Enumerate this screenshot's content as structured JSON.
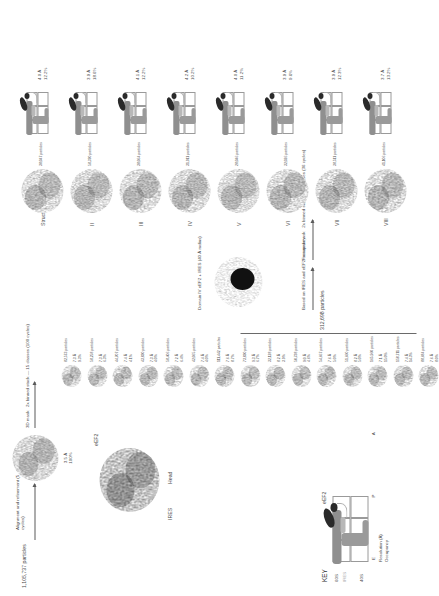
{
  "figure": {
    "input": {
      "particles": "1,105,737 particles",
      "step1": "Alignment and refinement (5 cycles)",
      "map1_resolution": "3.5 Å",
      "map1_occupancy": "100%"
    },
    "classification1": {
      "label": "3D mask   2x binned stack — 15 classes (100 cycles)",
      "selected_total": "312,698 particles",
      "classes": [
        {
          "particles": "82,573 particles",
          "resolution": "7.3 Å",
          "occupancy": "9.3%"
        },
        {
          "particles": "58,258 particles",
          "resolution": "7.3 Å",
          "occupancy": "6.3%"
        },
        {
          "particles": "44,707 particles",
          "resolution": "7.4 Å",
          "occupancy": "4.1%"
        },
        {
          "particles": "43,830 particles",
          "resolution": "7.3 Å",
          "occupancy": "4.0%"
        },
        {
          "particles": "58,406 particles",
          "resolution": "7.2 Å",
          "occupancy": "6.4%"
        },
        {
          "particles": "42,065 particles",
          "resolution": "7.4 Å",
          "occupancy": "4.0%"
        },
        {
          "particles": "111,442 particles",
          "resolution": "7.6 Å",
          "occupancy": "8.7%"
        },
        {
          "particles": "73,830 particles",
          "resolution": "9.3 Å",
          "occupancy": "6.7%"
        },
        {
          "particles": "32,128 particles",
          "resolution": "8.2 Å",
          "occupancy": "3.9%"
        },
        {
          "particles": "50,738 particles",
          "resolution": "9.0 Å",
          "occupancy": "4.6%"
        },
        {
          "particles": "54,667 particles",
          "resolution": "7.6 Å",
          "occupancy": "5.0%"
        },
        {
          "particles": "51,660 particles",
          "resolution": "8.2 Å",
          "occupancy": "5.0%"
        },
        {
          "particles": "165,960 particles",
          "resolution": "7.1 Å",
          "occupancy": "15.0%"
        },
        {
          "particles": "158,711 particles",
          "resolution": "7.4 Å",
          "occupancy": "14.3%"
        },
        {
          "particles": "88,684 particles",
          "resolution": "7.6 Å",
          "occupancy": "8.0%"
        }
      ]
    },
    "classification2": {
      "basis": "Based on IRES and eEF2 occupancy",
      "label": "Focused mask   2x binned stack — 8 classes (36 cycles)",
      "mask_label": "Domain IV eEF2 + IRES (40 Å radius)",
      "structures": [
        {
          "name": "Structure I",
          "particles": "38,047 particles",
          "resolution": "4.0 Å",
          "occupancy": "12.2%"
        },
        {
          "name": "II",
          "particles": "58,370 particles",
          "resolution": "3.9 Å",
          "occupancy": "18.6%"
        },
        {
          "name": "III",
          "particles": "38,064 particles",
          "resolution": "4.1 Å",
          "occupancy": "12.2%"
        },
        {
          "name": "IV",
          "particles": "31,911 particles",
          "resolution": "4.2 Å",
          "occupancy": "10.2%"
        },
        {
          "name": "V",
          "particles": "28,046 particles",
          "resolution": "4.0 Å",
          "occupancy": "11.2%"
        },
        {
          "name": "VI",
          "particles": "32,026 particles",
          "resolution": "3.9 Å",
          "occupancy": "9.6%"
        },
        {
          "name": "VII",
          "particles": "38,511 particles",
          "resolution": "3.9 Å",
          "occupancy": "12.3%"
        },
        {
          "name": "VIII",
          "particles": "41,106 particles",
          "resolution": "3.7 Å",
          "occupancy": "13.2%"
        }
      ]
    },
    "key": {
      "title": "KEY",
      "eef2": "eEF2",
      "sites": "E   P   A",
      "row_resolution": "Resolution (Å)",
      "row_occupancy": "Occupancy",
      "sub_60s": "60S",
      "sub_ires": "IRES",
      "sub_40s": "40S"
    },
    "map_annotations": {
      "eef2": "eEF2",
      "ires": "IRES",
      "head": "Head"
    },
    "colors": {
      "eef2": "#2a2a2a",
      "ires": "#b8b8b8",
      "subunit": "#8f8f8f",
      "grid": "#9a9a9a",
      "text": "#4a4a4a"
    }
  }
}
